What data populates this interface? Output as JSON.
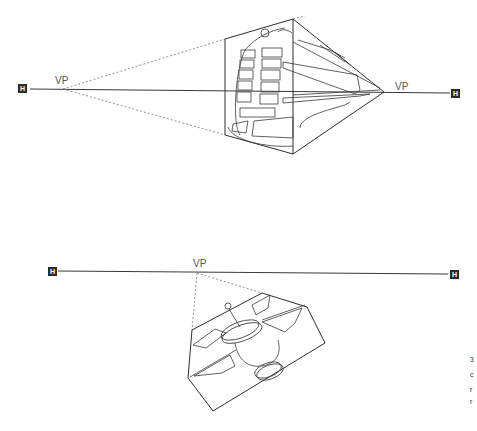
{
  "diagram_1": {
    "subject": "train",
    "horizon_marker_left": "H",
    "horizon_marker_right": "H",
    "vanishing_points": [
      {
        "label": "VP",
        "x": 63,
        "y": 89
      },
      {
        "label": "VP",
        "x": 384,
        "y": 92
      }
    ]
  },
  "diagram_2": {
    "subject": "satellite",
    "horizon_marker_left": "H",
    "horizon_marker_right": "H",
    "vanishing_points": [
      {
        "label": "VP",
        "x": 197,
        "y": 272
      }
    ]
  },
  "edge_text_fragments": [
    "3",
    "c",
    "r",
    "r"
  ]
}
